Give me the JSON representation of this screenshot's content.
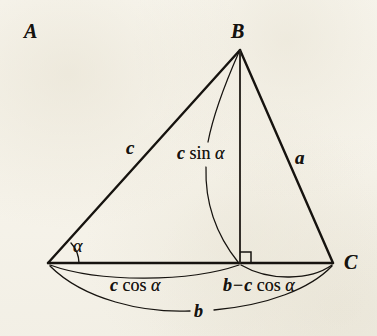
{
  "figure": {
    "background_color": "#f8f6ee",
    "ink_color": "#16130f",
    "vertices": {
      "A": {
        "label": "A",
        "x": 48,
        "y": 263
      },
      "B": {
        "label": "B",
        "x": 240,
        "y": 50
      },
      "C": {
        "label": "C",
        "x": 333,
        "y": 263
      },
      "foot": {
        "label": "",
        "x": 240,
        "y": 263
      }
    },
    "vertex_labels": [
      {
        "name": "vertex-label-a",
        "text": "A",
        "x": 24,
        "y": 254
      },
      {
        "name": "vertex-label-b",
        "text": "B",
        "x": 231,
        "y": 21
      },
      {
        "name": "vertex-label-c",
        "text": "C",
        "x": 344,
        "y": 254
      }
    ],
    "side_labels": [
      {
        "name": "side-label-c",
        "text": "c",
        "x": 126,
        "y": 138
      },
      {
        "name": "side-label-a",
        "text": "a",
        "x": 295,
        "y": 148
      }
    ],
    "angle_label": {
      "name": "angle-label-alpha",
      "text": "α",
      "x": 73,
      "y": 237
    },
    "altitude_label": {
      "name": "altitude-label",
      "parts": {
        "c": "c",
        "sin": "sin",
        "alpha": "α"
      },
      "x": 177,
      "y": 144
    },
    "segment_labels": [
      {
        "name": "segment-label-c-cos-alpha",
        "parts": {
          "c": "c",
          "cos": "cos",
          "alpha": "α"
        },
        "x": 110,
        "y": 276
      },
      {
        "name": "segment-label-b-minus-c-cos-alpha",
        "parts": {
          "b": "b",
          "minus": "−",
          "c": "c",
          "cos": "cos",
          "alpha": "α"
        },
        "x": 223,
        "y": 276
      },
      {
        "name": "segment-label-b",
        "parts": {
          "b": "b"
        },
        "x": 194,
        "y": 302
      }
    ],
    "right_angle_marker": {
      "name": "right-angle-marker",
      "x": 240,
      "y": 263,
      "size": 11
    },
    "relations": [
      "AD = c cos α",
      "DC = b − c cos α",
      "BD = c sin α",
      "AC = b"
    ]
  }
}
